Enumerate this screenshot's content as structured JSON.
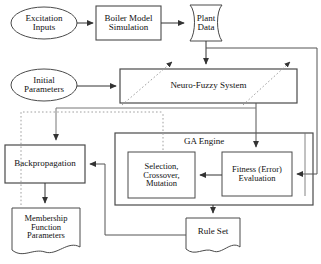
{
  "diagram": {
    "nodes": {
      "excitation_inputs": {
        "label": "Excitation\nInputs",
        "shape": "ellipse"
      },
      "boiler_model_simulation": {
        "label": "Boiler Model\nSimulation",
        "shape": "rectangle"
      },
      "plant_data": {
        "label": "Plant\nData",
        "shape": "data-curved"
      },
      "initial_parameters": {
        "label": "Initial\nParameters",
        "shape": "ellipse"
      },
      "neuro_fuzzy_system": {
        "label": "Neuro-Fuzzy System",
        "shape": "rectangle"
      },
      "backpropagation": {
        "label": "Backpropagation",
        "shape": "rectangle"
      },
      "membership_function_parameters": {
        "label": "Membership\nFunction\nParameters",
        "shape": "document"
      },
      "ga_engine": {
        "label": "GA Engine",
        "shape": "container"
      },
      "selection_crossover_mutation": {
        "label": "Selection,\nCrossover,\nMutation",
        "shape": "rectangle"
      },
      "fitness_error_evaluation": {
        "label": "Fitness (Error)\nEvaluation",
        "shape": "rectangle"
      },
      "rule_set": {
        "label": "Rule Set",
        "shape": "document"
      }
    },
    "edges": [
      {
        "from": "excitation_inputs",
        "to": "boiler_model_simulation",
        "style": "solid"
      },
      {
        "from": "boiler_model_simulation",
        "to": "plant_data",
        "style": "solid"
      },
      {
        "from": "plant_data",
        "to": "neuro_fuzzy_system",
        "style": "solid"
      },
      {
        "from": "plant_data",
        "to": "fitness_error_evaluation",
        "style": "solid"
      },
      {
        "from": "initial_parameters",
        "to": "neuro_fuzzy_system",
        "style": "solid"
      },
      {
        "from": "neuro_fuzzy_system",
        "to": "fitness_error_evaluation",
        "style": "solid"
      },
      {
        "from": "neuro_fuzzy_system",
        "to": "backpropagation",
        "style": "solid"
      },
      {
        "from": "backpropagation",
        "to": "membership_function_parameters",
        "style": "solid"
      },
      {
        "from": "membership_function_parameters",
        "to": "neuro_fuzzy_system",
        "style": "dotted"
      },
      {
        "from": "fitness_error_evaluation",
        "to": "selection_crossover_mutation",
        "style": "solid"
      },
      {
        "from": "selection_crossover_mutation",
        "to": "rule_set",
        "style": "solid"
      },
      {
        "from": "rule_set",
        "to": "backpropagation",
        "style": "solid"
      },
      {
        "from": "rule_set",
        "to": "neuro_fuzzy_system",
        "style": "dotted"
      }
    ],
    "colors": {
      "stroke": "#4a4a4a",
      "text": "#111111",
      "background": "#ffffff",
      "dotted": "#9a9a9a"
    }
  }
}
